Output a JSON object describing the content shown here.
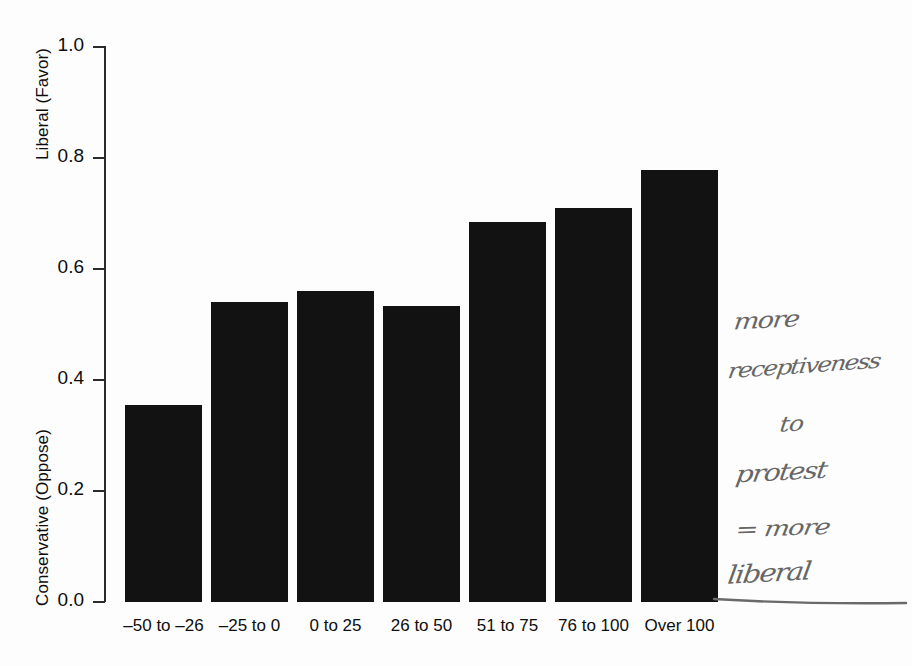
{
  "chart_data": {
    "type": "bar",
    "title": "",
    "subtitle": "",
    "xlabel": "",
    "ylabel_top": "Liberal (Favor)",
    "ylabel_bottom": "Conservative (Oppose)",
    "categories": [
      "–50 to –26",
      "–25 to 0",
      "0 to 25",
      "26 to 50",
      "51 to 75",
      "76 to 100",
      "Over 100"
    ],
    "values": [
      0.355,
      0.539,
      0.56,
      0.533,
      0.683,
      0.708,
      0.777
    ],
    "ylim": [
      0.0,
      1.0
    ],
    "ytick_labels": [
      "1.0",
      "0.8",
      "0.6",
      "0.4",
      "0.2",
      "0.0"
    ],
    "ytick_values": [
      1.0,
      0.8,
      0.6,
      0.4,
      0.2,
      0.0
    ],
    "grid": false,
    "legend": null,
    "bar_color": "#121212",
    "axis_color": "#2b2b2b"
  },
  "annotation": {
    "color": "#5a5a5a",
    "lines": [
      "more",
      "receptiveness",
      "to",
      "protest",
      "= more",
      "liberal"
    ]
  }
}
